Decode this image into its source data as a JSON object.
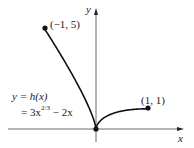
{
  "chart_data": {
    "type": "line",
    "title": "",
    "xlabel": "x",
    "ylabel": "y",
    "function_label": "y = h(x)",
    "function_expr_prefix": "= 3x",
    "function_expr_exp": "2/3",
    "function_expr_suffix": " − 2x",
    "domain": [
      -1,
      1
    ],
    "series": [
      {
        "name": "h(x) = 3x^(2/3) - 2x",
        "x": [
          -1,
          -0.75,
          -0.5,
          -0.25,
          -0.1,
          0,
          0.1,
          0.25,
          0.5,
          0.75,
          1
        ],
        "y": [
          5,
          3.98,
          2.89,
          1.69,
          0.85,
          0,
          0.45,
          0.69,
          0.89,
          0.98,
          1
        ]
      }
    ],
    "points": [
      {
        "x": -1,
        "y": 5,
        "label": "(−1, 5)"
      },
      {
        "x": 0,
        "y": 0,
        "label": ""
      },
      {
        "x": 1,
        "y": 1,
        "label": "(1, 1)"
      }
    ],
    "grid": false,
    "legend": "none"
  },
  "labels": {
    "point_left": "(−1, 5)",
    "point_right": "(1, 1)",
    "x_axis": "x",
    "y_axis": "y",
    "eq_line1": "y = h(x)",
    "eq_prefix": "= 3x",
    "eq_exp": "2/3",
    "eq_suffix": " − 2x"
  }
}
